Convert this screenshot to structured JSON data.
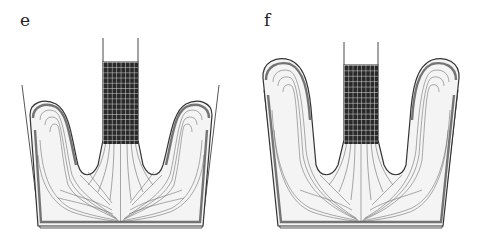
{
  "figure": {
    "panels": [
      {
        "id": "e",
        "label": "e",
        "description": "Simulated flow: central meshed stem pushing down into container, streamlines curving up into two side lobes",
        "stem": {
          "left_x": 103,
          "right_x": 138,
          "top_y": 38,
          "mesh_top_y": 62
        },
        "container": {
          "top_left": [
            22,
            85
          ],
          "bottom_left": [
            40,
            228
          ],
          "top_right": [
            219,
            85
          ],
          "bottom_right": [
            202,
            228
          ]
        },
        "lobe_top_y": 105
      },
      {
        "id": "f",
        "label": "f",
        "description": "Later stage: side lobes risen higher and tilted outward, streamline pattern extended",
        "stem": {
          "left_x": 104,
          "right_x": 138,
          "top_y": 42,
          "mesh_top_y": 65
        },
        "container": {
          "top_left": [
            22,
            90
          ],
          "bottom_left": [
            40,
            228
          ],
          "top_right": [
            219,
            90
          ],
          "bottom_right": [
            202,
            228
          ]
        },
        "lobe_top_y": 58
      }
    ],
    "colors": {
      "ink": "#222222",
      "mesh_fill": "#2a2a2a",
      "mesh_lines": "#e8e8e8",
      "background": "#ffffff"
    }
  }
}
